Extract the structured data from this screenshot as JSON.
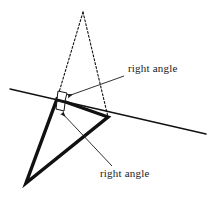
{
  "figure": {
    "type": "geometry-diagram",
    "background_color": "#ffffff",
    "stroke_color": "#111111",
    "width": 212,
    "height": 198,
    "annotations": [
      {
        "id": "upper",
        "label": "right angle",
        "label_x": 128,
        "label_y": 72,
        "arrow_from_x": 124,
        "arrow_from_y": 76,
        "arrow_to_x": 68,
        "arrow_to_y": 96
      },
      {
        "id": "lower",
        "label": "right angle",
        "label_x": 100,
        "label_y": 177,
        "arrow_from_x": 112,
        "arrow_from_y": 166,
        "arrow_to_x": 62,
        "arrow_to_y": 113
      }
    ],
    "shapes": {
      "transversal_line": {
        "name": "long-straight-line",
        "x1": 10,
        "y1": 89,
        "x2": 206,
        "y2": 134,
        "stroke_width": 1.4
      },
      "dotted_triangle": {
        "name": "dotted-triangle",
        "apex_x": 83,
        "apex_y": 12,
        "left_x": 57,
        "left_y": 99,
        "right_x": 108,
        "right_y": 117,
        "stroke_width": 1.1,
        "dash": "2,2"
      },
      "bold_triangle": {
        "name": "bold-triangle",
        "top_x": 57,
        "top_y": 99,
        "bottom_x": 26,
        "bottom_y": 183,
        "right_x": 108,
        "right_y": 117,
        "stroke_width": 3.4
      },
      "right_angle_mark_upper": {
        "name": "right-angle-mark-upper",
        "points": "58,91 67,93 65,101 57,99",
        "stroke_width": 1.0
      },
      "right_angle_mark_lower": {
        "name": "right-angle-mark-lower",
        "points": "57,101 65,103 64,111 56,109",
        "stroke_width": 1.0
      }
    }
  }
}
